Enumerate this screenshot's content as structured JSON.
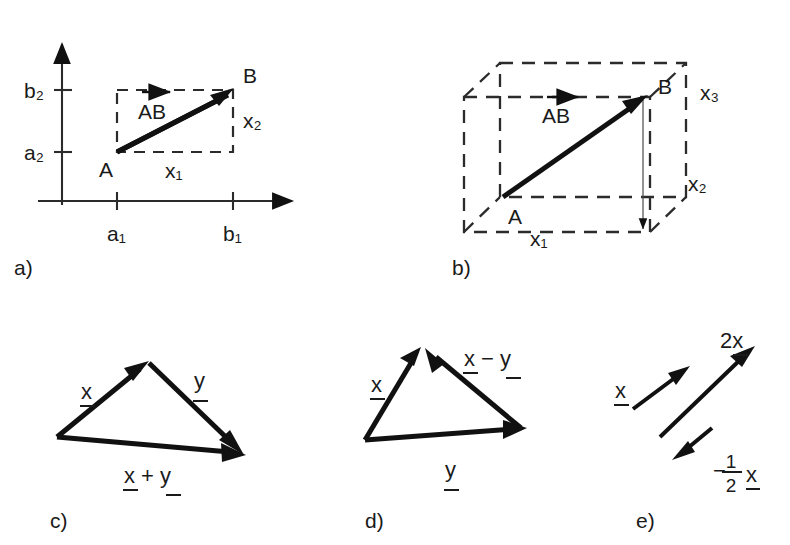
{
  "figure": {
    "background_color": "#ffffff",
    "ink_color": "#1a1a1a"
  },
  "panels": [
    {
      "id": "a",
      "label": "a)",
      "caption": "Vector AB in the plane with components x1 and x2",
      "axes": {
        "x_axis": true,
        "y_axis": true,
        "arrowheads": true,
        "grid": false
      },
      "tick_labels": {
        "x": [
          "a₁",
          "b₁"
        ],
        "y": [
          "b₂",
          "a₂"
        ]
      },
      "point_labels": [
        "A",
        "B"
      ],
      "vector_label": "AB",
      "vector_label_accent": "arrow-right",
      "component_labels": [
        "x₁",
        "x₂"
      ],
      "bounding_box_style": "dashed"
    },
    {
      "id": "b",
      "label": "b)",
      "caption": "Vector AB in space with components x1, x2 and x3",
      "point_labels": [
        "A",
        "B"
      ],
      "vector_label": "AB",
      "vector_label_accent": "arrow-right",
      "component_labels": [
        "x₁",
        "x₂",
        "x₃"
      ],
      "bounding_box_style": "dashed",
      "box_kind": "3d-parallelepiped"
    },
    {
      "id": "c",
      "label": "c)",
      "caption": "Vector addition",
      "vectors": [
        {
          "name": "x-vector",
          "label": "x",
          "underlined": true
        },
        {
          "name": "y-vector",
          "label": "y",
          "underlined": true
        },
        {
          "name": "sum-vector",
          "label": "x + y",
          "underlined": true
        }
      ]
    },
    {
      "id": "d",
      "label": "d)",
      "caption": "Vector subtraction",
      "vectors": [
        {
          "name": "x-vector",
          "label": "x",
          "underlined": true
        },
        {
          "name": "y-vector",
          "label": "y",
          "underlined": true
        },
        {
          "name": "diff-vector",
          "label": "x − y",
          "underlined": true
        }
      ]
    },
    {
      "id": "e",
      "label": "e)",
      "caption": "Multiplication of a vector by a scalar",
      "vectors": [
        {
          "name": "x-vector",
          "label": "x",
          "underlined": true
        },
        {
          "name": "two-x-vector",
          "label": "2x",
          "underlined": true
        },
        {
          "name": "neg-half-x-vector",
          "label_minus": "−",
          "label_numerator": "1",
          "label_denominator": "2",
          "label_variable": "x",
          "underlined": true
        }
      ]
    }
  ]
}
